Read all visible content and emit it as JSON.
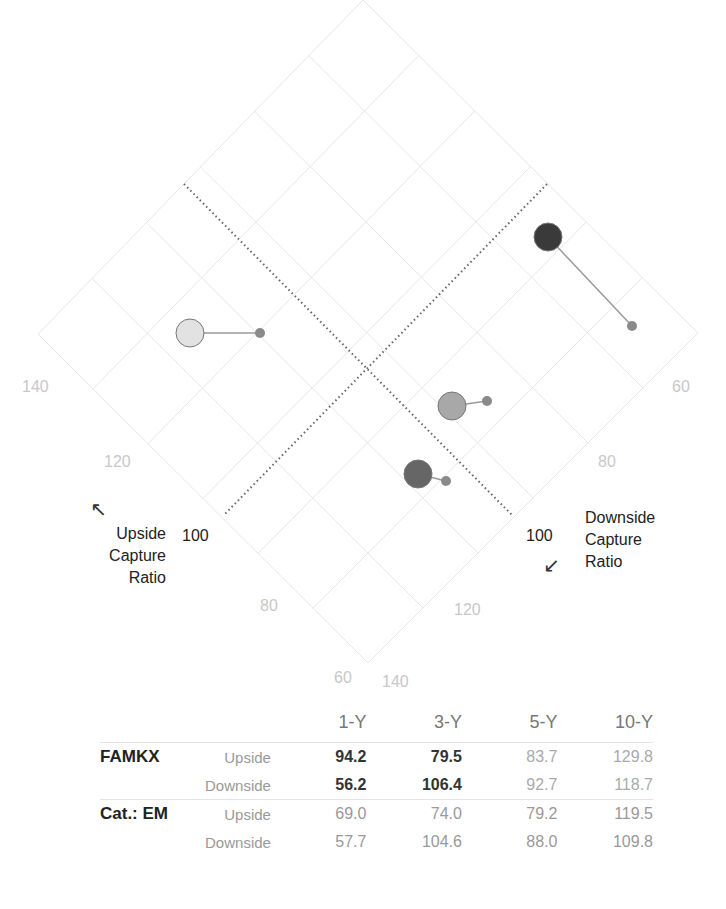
{
  "chart_data": {
    "type": "scatter",
    "xlabel": "Downside Capture Ratio",
    "ylabel": "Upside Capture Ratio",
    "axes": {
      "upside": {
        "label": "Upside Capture Ratio",
        "ticks": [
          140,
          120,
          100,
          80,
          60
        ],
        "reference_line": 100
      },
      "downside": {
        "label": "Downside Capture Ratio",
        "ticks": [
          60,
          80,
          100,
          120,
          140
        ],
        "reference_line": 100
      }
    },
    "grid": true,
    "categories": [
      "1-Y",
      "3-Y",
      "5-Y",
      "10-Y"
    ],
    "series": [
      {
        "name": "FAMKX",
        "upside": [
          94.2,
          79.5,
          83.7,
          129.8
        ],
        "downside": [
          56.2,
          106.4,
          92.7,
          118.7
        ]
      },
      {
        "name": "Cat.: EM",
        "upside": [
          69.0,
          74.0,
          79.2,
          119.5
        ],
        "downside": [
          57.7,
          104.6,
          88.0,
          109.8
        ]
      }
    ],
    "points_px": [
      {
        "period": "1-Y",
        "fund": {
          "x": 548,
          "y": 237,
          "r": 14,
          "fill": "#3a3a3a"
        },
        "cat": {
          "x": 632,
          "y": 326,
          "r": 5
        }
      },
      {
        "period": "3-Y",
        "fund": {
          "x": 418,
          "y": 474,
          "r": 14,
          "fill": "#666666"
        },
        "cat": {
          "x": 446,
          "y": 481,
          "r": 5
        }
      },
      {
        "period": "5-Y",
        "fund": {
          "x": 452,
          "y": 406,
          "r": 14,
          "fill": "#a8a8a8"
        },
        "cat": {
          "x": 487,
          "y": 401,
          "r": 5
        }
      },
      {
        "period": "10-Y",
        "fund": {
          "x": 190,
          "y": 333,
          "r": 14,
          "fill": "#e2e2e2"
        },
        "cat": {
          "x": 260,
          "y": 333,
          "r": 5
        }
      }
    ]
  },
  "labels": {
    "upside_title": [
      "Upside",
      "Capture",
      "Ratio"
    ],
    "downside_title": [
      "Downside",
      "Capture",
      "Ratio"
    ],
    "upside_arrow": "↖",
    "downside_arrow": "↙",
    "ticks_upside": [
      "140",
      "120",
      "100",
      "80",
      "60"
    ],
    "ticks_downside": [
      "60",
      "80",
      "100",
      "120",
      "140"
    ]
  },
  "table": {
    "headers": [
      "1-Y",
      "3-Y",
      "5-Y",
      "10-Y"
    ],
    "groups": [
      {
        "name": "FAMKX",
        "rows": [
          {
            "label": "Upside",
            "values": [
              "94.2",
              "79.5",
              "83.7",
              "129.8"
            ]
          },
          {
            "label": "Downside",
            "values": [
              "56.2",
              "106.4",
              "92.7",
              "118.7"
            ]
          }
        ]
      },
      {
        "name": "Cat.: EM",
        "rows": [
          {
            "label": "Upside",
            "values": [
              "69.0",
              "74.0",
              "79.2",
              "119.5"
            ]
          },
          {
            "label": "Downside",
            "values": [
              "57.7",
              "104.6",
              "88.0",
              "109.8"
            ]
          }
        ]
      }
    ]
  }
}
